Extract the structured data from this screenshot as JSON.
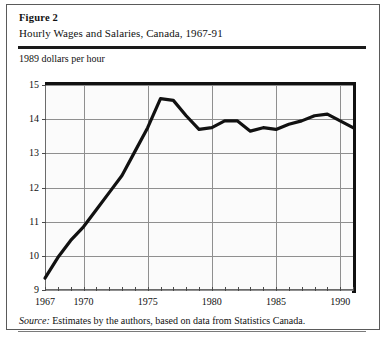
{
  "figure": {
    "number_label": "Figure 2",
    "title": "Hourly Wages and Salaries, Canada, 1967-91",
    "source_word": "Source:",
    "source_text": "Estimates by the authors, based on data from Statistics Canada."
  },
  "chart_data": {
    "type": "line",
    "title": "Hourly Wages and Salaries, Canada, 1967-91",
    "subtitle": "Figure 2",
    "xlabel": "",
    "ylabel": "1989 dollars per hour",
    "xlim": [
      1967,
      1991
    ],
    "ylim": [
      9,
      15
    ],
    "grid": true,
    "legend": "none",
    "y_ticks": [
      9,
      10,
      11,
      12,
      13,
      14,
      15
    ],
    "y_tick_labels": [
      "9",
      "10",
      "11",
      "12",
      "13",
      "14",
      "15"
    ],
    "x_ticks": [
      1967,
      1970,
      1975,
      1980,
      1985,
      1990
    ],
    "x_tick_labels": [
      "1967",
      "1970",
      "1975",
      "1980",
      "1985",
      "1990"
    ],
    "x_minor_ticks": [
      1967,
      1968,
      1969,
      1970,
      1971,
      1972,
      1973,
      1974,
      1975,
      1976,
      1977,
      1978,
      1979,
      1980,
      1981,
      1982,
      1983,
      1984,
      1985,
      1986,
      1987,
      1988,
      1989,
      1990,
      1991
    ],
    "series": [
      {
        "name": "Hourly wages and salaries",
        "color": "#111111",
        "x": [
          1967,
          1968,
          1969,
          1970,
          1971,
          1972,
          1973,
          1974,
          1975,
          1976,
          1977,
          1978,
          1979,
          1980,
          1981,
          1982,
          1983,
          1984,
          1985,
          1986,
          1987,
          1988,
          1989,
          1990,
          1991
        ],
        "values": [
          9.35,
          9.95,
          10.45,
          10.85,
          11.35,
          11.85,
          12.35,
          13.05,
          13.75,
          14.6,
          14.55,
          14.1,
          13.7,
          13.75,
          13.95,
          13.95,
          13.65,
          13.75,
          13.7,
          13.85,
          13.95,
          14.1,
          14.15,
          13.95,
          13.75
        ]
      }
    ]
  }
}
